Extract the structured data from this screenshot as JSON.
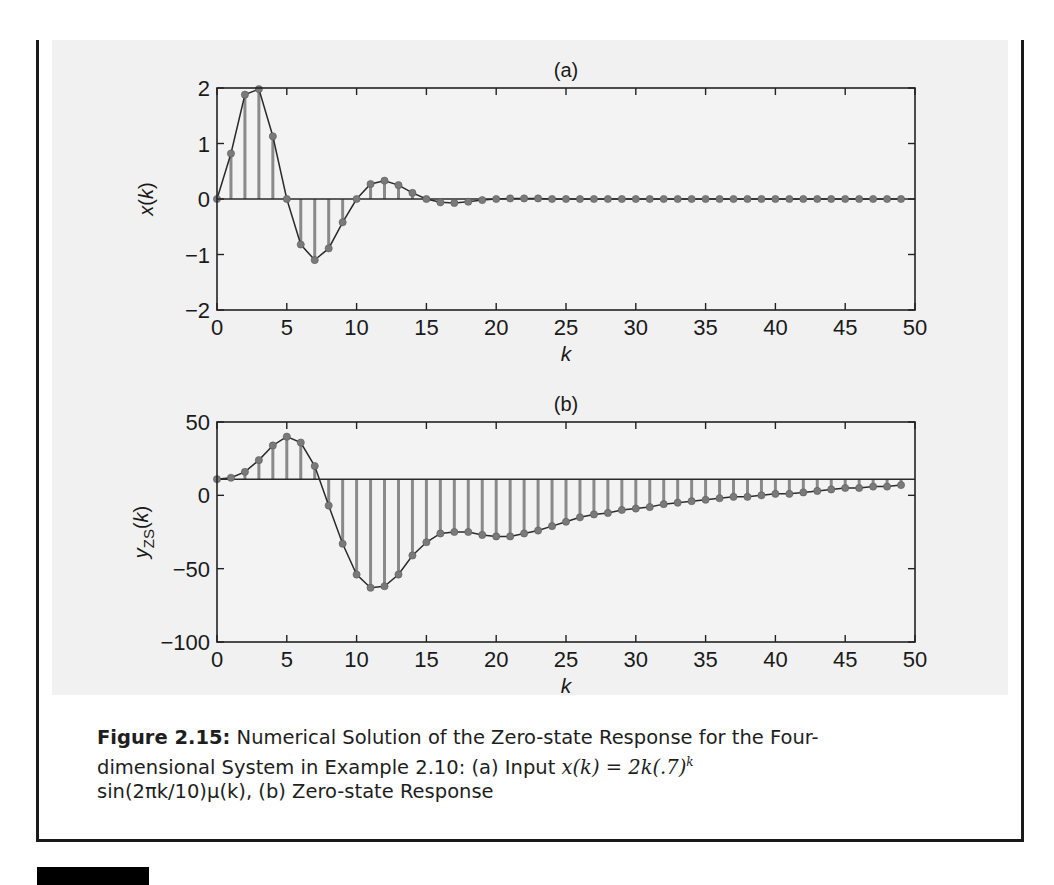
{
  "figure": {
    "label": "Figure 2.15:",
    "caption_line1": "Numerical Solution of the Zero-state Response for the Four-",
    "caption_line2_a": "dimensional System in Example 2.10: (a) Input ",
    "caption_line2_math": "x(k) = 2k(.7)",
    "caption_line2_sup": "k",
    "caption_line3": "sin(2πk/10)μ(k), (b) Zero-state Response"
  },
  "colors": {
    "stem": "#8a8a8a",
    "marker": "#7a7a7a",
    "line": "#2a2a2a",
    "axes": "#222222",
    "figure_bg": "#f1f1f1"
  },
  "chart_data": [
    {
      "type": "line",
      "subtype": "stem",
      "title": "(a)",
      "xlabel": "k",
      "ylabel": "x(k)",
      "xlim": [
        0,
        50
      ],
      "ylim": [
        -2,
        2
      ],
      "xticks": [
        0,
        5,
        10,
        15,
        20,
        25,
        30,
        35,
        40,
        45,
        50
      ],
      "yticks": [
        -2,
        -1,
        0,
        1,
        2
      ],
      "baseline": 0,
      "grid": false,
      "x": [
        0,
        1,
        2,
        3,
        4,
        5,
        6,
        7,
        8,
        9,
        10,
        11,
        12,
        13,
        14,
        15,
        16,
        17,
        18,
        19,
        20,
        21,
        22,
        23,
        24,
        25,
        26,
        27,
        28,
        29,
        30,
        31,
        32,
        33,
        34,
        35,
        36,
        37,
        38,
        39,
        40,
        41,
        42,
        43,
        44,
        45,
        46,
        47,
        48,
        49
      ],
      "values": [
        0,
        0.82,
        1.88,
        1.98,
        1.13,
        0,
        -0.82,
        -1.1,
        -0.89,
        -0.42,
        0,
        0.27,
        0.33,
        0.25,
        0.11,
        0,
        -0.06,
        -0.07,
        -0.05,
        -0.02,
        0,
        0.01,
        0.01,
        0.01,
        0,
        0,
        0,
        0,
        0,
        0,
        0,
        0,
        0,
        0,
        0,
        0,
        0,
        0,
        0,
        0,
        0,
        0,
        0,
        0,
        0,
        0,
        0,
        0,
        0,
        0
      ]
    },
    {
      "type": "line",
      "subtype": "stem",
      "title": "(b)",
      "xlabel": "k",
      "ylabel": "y_ZS(k)",
      "xlim": [
        0,
        50
      ],
      "ylim": [
        -100,
        50
      ],
      "xticks": [
        0,
        5,
        10,
        15,
        20,
        25,
        30,
        35,
        40,
        45,
        50
      ],
      "yticks": [
        -100,
        -50,
        0,
        50
      ],
      "baseline": 11,
      "grid": false,
      "x": [
        0,
        1,
        2,
        3,
        4,
        5,
        6,
        7,
        8,
        9,
        10,
        11,
        12,
        13,
        14,
        15,
        16,
        17,
        18,
        19,
        20,
        21,
        22,
        23,
        24,
        25,
        26,
        27,
        28,
        29,
        30,
        31,
        32,
        33,
        34,
        35,
        36,
        37,
        38,
        39,
        40,
        41,
        42,
        43,
        44,
        45,
        46,
        47,
        48,
        49
      ],
      "values": [
        11,
        12,
        16,
        24,
        34,
        40,
        36,
        20,
        -7,
        -33,
        -54,
        -63,
        -62,
        -54,
        -41,
        -32,
        -26,
        -25,
        -25,
        -27,
        -28,
        -28,
        -26,
        -24,
        -21,
        -18,
        -15,
        -13,
        -12,
        -10,
        -9,
        -8,
        -6,
        -5,
        -4,
        -3,
        -2,
        -1,
        -1,
        0,
        1,
        1,
        2,
        3,
        4,
        5,
        5,
        6,
        6,
        7
      ]
    }
  ]
}
